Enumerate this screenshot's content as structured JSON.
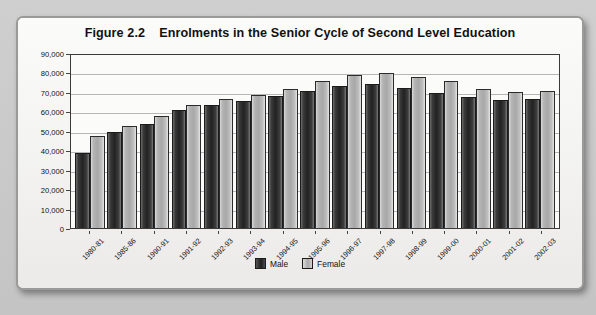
{
  "figure": {
    "label": "Figure 2.2",
    "title": "Enrolments in the Senior Cycle of Second Level Education"
  },
  "legend": {
    "male_label": "Male",
    "female_label": "Female"
  },
  "colors": {
    "male": "#222222",
    "female": "#b4b4b4",
    "axis": "#3a3a3a",
    "grid": "#b6b6b6",
    "card": "#f4f4f2"
  },
  "chart_data": {
    "type": "bar",
    "xlabel": "",
    "ylabel": "",
    "ylim": [
      0,
      90000
    ],
    "ytick_step": 10000,
    "grid": true,
    "legend_position": "bottom",
    "categories": [
      "1980-81",
      "1985-86",
      "1990-91",
      "1991-92",
      "1992-93",
      "1993-94",
      "1994-95",
      "1995-96",
      "1996-97",
      "1997-98",
      "1998-99",
      "1999-00",
      "2000-01",
      "2001-02",
      "2002-03"
    ],
    "ytick_labels": [
      "90,000",
      "80,000",
      "70,000",
      "60,000",
      "50,000",
      "40,000",
      "30,000",
      "20,000",
      "10,000",
      "0"
    ],
    "series": [
      {
        "name": "Male",
        "values": [
          38500,
          49500,
          53500,
          60500,
          63500,
          65500,
          68000,
          70500,
          73000,
          74000,
          72000,
          69500,
          67500,
          66000,
          66500
        ]
      },
      {
        "name": "Female",
        "values": [
          47500,
          52500,
          57500,
          63500,
          66500,
          68500,
          71500,
          75500,
          78500,
          79500,
          77500,
          75500,
          71500,
          70000,
          70500
        ]
      }
    ]
  }
}
